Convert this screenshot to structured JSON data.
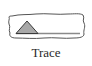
{
  "tool": {
    "label": "Trace",
    "icon": "trace-triangle-icon",
    "colors": {
      "border": "#555555",
      "triangle_fill": "#a8a8a8",
      "triangle_stroke": "#3a3a3a",
      "baseline": "#8a8a8a",
      "label": "#2a2a2a"
    }
  }
}
